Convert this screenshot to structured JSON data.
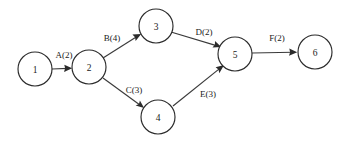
{
  "diagram": {
    "type": "activity-on-arrow-network",
    "title": "",
    "background_color": "#ffffff",
    "stroke_color": "#2b2b2b",
    "text_color": "#1a1a1a",
    "nodes": [
      {
        "id": "1",
        "label": "1",
        "cx": 35,
        "cy": 69,
        "r": 17
      },
      {
        "id": "2",
        "label": "2",
        "cx": 89,
        "cy": 67,
        "r": 17
      },
      {
        "id": "3",
        "label": "3",
        "cx": 156,
        "cy": 26,
        "r": 17
      },
      {
        "id": "4",
        "label": "4",
        "cx": 158,
        "cy": 117,
        "r": 17
      },
      {
        "id": "5",
        "label": "5",
        "cx": 235,
        "cy": 54,
        "r": 17
      },
      {
        "id": "6",
        "label": "6",
        "cx": 315,
        "cy": 52,
        "r": 17
      }
    ],
    "edges": [
      {
        "id": "A",
        "label": "A(2)",
        "activity": "A",
        "duration": 2,
        "from": "1",
        "to": "2",
        "x1": 52,
        "y1": 69,
        "x2": 72,
        "y2": 68,
        "label_x": 64,
        "label_y": 55
      },
      {
        "id": "B",
        "label": "B(4)",
        "activity": "B",
        "duration": 4,
        "from": "2",
        "to": "3",
        "x1": 103,
        "y1": 58,
        "x2": 141,
        "y2": 34,
        "label_x": 112,
        "label_y": 38
      },
      {
        "id": "C",
        "label": "C(3)",
        "activity": "C",
        "duration": 3,
        "from": "2",
        "to": "4",
        "x1": 103,
        "y1": 78,
        "x2": 144,
        "y2": 108,
        "label_x": 134,
        "label_y": 90
      },
      {
        "id": "D",
        "label": "D(2)",
        "activity": "D",
        "duration": 2,
        "from": "3",
        "to": "5",
        "x1": 171,
        "y1": 32,
        "x2": 221,
        "y2": 47,
        "label_x": 204,
        "label_y": 32
      },
      {
        "id": "E",
        "label": "E(3)",
        "activity": "E",
        "duration": 3,
        "from": "4",
        "to": "5",
        "x1": 173,
        "y1": 106,
        "x2": 224,
        "y2": 65,
        "label_x": 208,
        "label_y": 94
      },
      {
        "id": "F",
        "label": "F(2)",
        "activity": "F",
        "duration": 2,
        "from": "5",
        "to": "6",
        "x1": 252,
        "y1": 53,
        "x2": 297,
        "y2": 52,
        "label_x": 277,
        "label_y": 38
      }
    ]
  }
}
